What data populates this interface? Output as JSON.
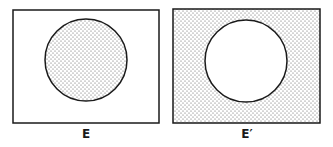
{
  "panels": [
    {
      "label": "E",
      "shaded_region": "circle",
      "box": {
        "x": 13,
        "y": 10,
        "w": 146,
        "h": 113
      },
      "circle": {
        "cx": 86,
        "cy": 60,
        "r": 41
      }
    },
    {
      "label": "E′",
      "shaded_region": "outside-circle",
      "box": {
        "x": 173,
        "y": 9,
        "w": 147,
        "h": 114
      },
      "circle": {
        "cx": 246,
        "cy": 61,
        "r": 41
      }
    }
  ],
  "colors": {
    "stroke": "#1a1a1a",
    "dots": "#555555"
  }
}
